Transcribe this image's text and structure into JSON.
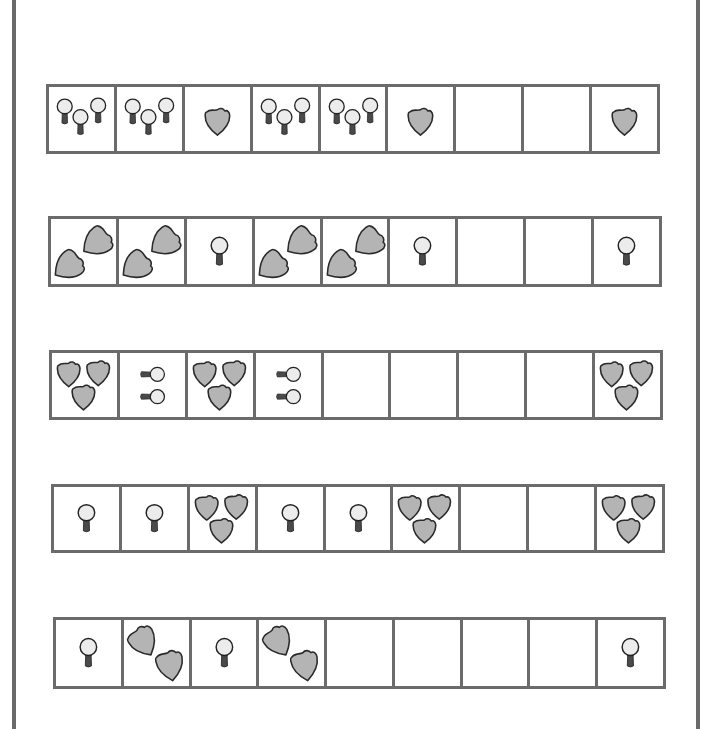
{
  "worksheet": {
    "type": "pattern-completion",
    "colors": {
      "border": "#6b6b6b",
      "shield_fill": "#b4b4b4",
      "shield_stroke": "#2a2a2a",
      "lollipop_head": "#ececec",
      "lollipop_stick": "#4a4a4a"
    },
    "rows": [
      {
        "cells": [
          {
            "content": "lollipop-x3"
          },
          {
            "content": "lollipop-x3"
          },
          {
            "content": "shield-x1"
          },
          {
            "content": "lollipop-x3"
          },
          {
            "content": "lollipop-x3"
          },
          {
            "content": "shield-x1"
          },
          {
            "content": "empty"
          },
          {
            "content": "empty"
          },
          {
            "content": "shield-x1"
          }
        ]
      },
      {
        "cells": [
          {
            "content": "shield-x2-diagonal-up"
          },
          {
            "content": "shield-x2-diagonal-up"
          },
          {
            "content": "lollipop-x1"
          },
          {
            "content": "shield-x2-diagonal-up"
          },
          {
            "content": "shield-x2-diagonal-up"
          },
          {
            "content": "lollipop-x1"
          },
          {
            "content": "empty"
          },
          {
            "content": "empty"
          },
          {
            "content": "lollipop-x1"
          }
        ]
      },
      {
        "cells": [
          {
            "content": "shield-x3"
          },
          {
            "content": "lollipop-x2-horizontal"
          },
          {
            "content": "shield-x3"
          },
          {
            "content": "lollipop-x2-horizontal"
          },
          {
            "content": "empty"
          },
          {
            "content": "empty"
          },
          {
            "content": "empty"
          },
          {
            "content": "empty"
          },
          {
            "content": "shield-x3"
          }
        ]
      },
      {
        "cells": [
          {
            "content": "lollipop-x1"
          },
          {
            "content": "lollipop-x1"
          },
          {
            "content": "shield-x3"
          },
          {
            "content": "lollipop-x1"
          },
          {
            "content": "lollipop-x1"
          },
          {
            "content": "shield-x3"
          },
          {
            "content": "empty"
          },
          {
            "content": "empty"
          },
          {
            "content": "shield-x3"
          }
        ]
      },
      {
        "cells": [
          {
            "content": "lollipop-x1"
          },
          {
            "content": "shield-x2-diagonal-down"
          },
          {
            "content": "lollipop-x1"
          },
          {
            "content": "shield-x2-diagonal-down"
          },
          {
            "content": "empty"
          },
          {
            "content": "empty"
          },
          {
            "content": "empty"
          },
          {
            "content": "empty"
          },
          {
            "content": "lollipop-x1"
          }
        ]
      }
    ]
  }
}
